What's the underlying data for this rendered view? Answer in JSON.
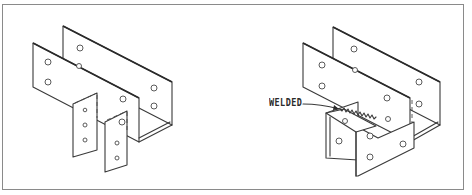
{
  "figure": {
    "type": "isometric technical illustration",
    "panels": [
      {
        "id": "left",
        "description": "U-channel saddle hanger with two separate strap legs bolted below"
      },
      {
        "id": "right",
        "description": "U-channel saddle hanger with a U-shaped bracket welded underneath",
        "annotation": "WELDED"
      }
    ],
    "colors": {
      "line": "#3a3a3a",
      "frame": "#8a8a8a",
      "background": "#ffffff"
    }
  }
}
